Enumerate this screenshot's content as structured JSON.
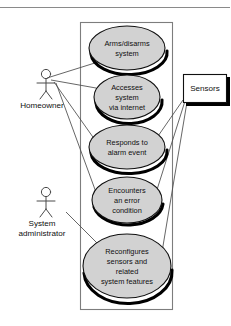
{
  "diagram": {
    "type": "uml-use-case-diagram",
    "background_color": "#ffffff",
    "ellipse_fill": "#d2d2d2",
    "ellipse_stroke": "#101010",
    "boundary_stroke": "#7d7d7d",
    "line_color": "#4a4a4a"
  },
  "system_boundary": {
    "name": "system-boundary",
    "x": 80,
    "y": 22,
    "width": 93,
    "height": 288
  },
  "actors": [
    {
      "id": "homeowner",
      "label": "Homeowner",
      "label_lines": [
        "Homeowner"
      ],
      "x": 46,
      "y": 72
    },
    {
      "id": "system-administrator",
      "label": "System administrator",
      "label_lines": [
        "System",
        "administrator"
      ],
      "x": 46,
      "y": 190
    }
  ],
  "use_cases": [
    {
      "id": "arms-disarms-system",
      "lines": [
        "Arms/disarms",
        "system"
      ],
      "cx": 127,
      "cy": 48,
      "rx": 38,
      "ry": 22
    },
    {
      "id": "accesses-system-via-internet",
      "lines": [
        "Accesses",
        "system",
        "via internet"
      ],
      "cx": 127,
      "cy": 97,
      "rx": 33,
      "ry": 22
    },
    {
      "id": "responds-to-alarm-event",
      "lines": [
        "Responds to",
        "alarm event"
      ],
      "cx": 127,
      "cy": 147,
      "rx": 38,
      "ry": 22
    },
    {
      "id": "encounters-an-error-condition",
      "lines": [
        "Encounters",
        "an error",
        "condition"
      ],
      "cx": 127,
      "cy": 200,
      "rx": 35,
      "ry": 23
    },
    {
      "id": "reconfigures-sensors-and-related-system-features",
      "lines": [
        "Reconfigures",
        "sensors and",
        "related",
        "system features"
      ],
      "cx": 127,
      "cy": 266,
      "rx": 44,
      "ry": 32
    }
  ],
  "external_entities": [
    {
      "id": "sensors",
      "label": "Sensors",
      "x": 183,
      "y": 74,
      "width": 44,
      "height": 29
    }
  ],
  "associations": [
    {
      "from": "homeowner",
      "to": "arms-disarms-system"
    },
    {
      "from": "homeowner",
      "to": "accesses-system-via-internet"
    },
    {
      "from": "homeowner",
      "to": "responds-to-alarm-event"
    },
    {
      "from": "homeowner",
      "to": "encounters-an-error-condition"
    },
    {
      "from": "system-administrator",
      "to": "reconfigures-sensors-and-related-system-features"
    },
    {
      "from": "sensors",
      "to": "responds-to-alarm-event"
    },
    {
      "from": "sensors",
      "to": "encounters-an-error-condition"
    },
    {
      "from": "sensors",
      "to": "reconfigures-sensors-and-related-system-features"
    }
  ]
}
